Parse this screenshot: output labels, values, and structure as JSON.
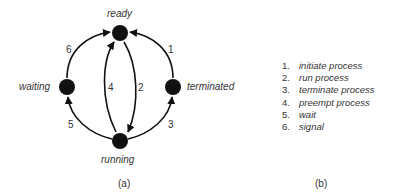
{
  "diagram": {
    "nodes": [
      {
        "id": "ready",
        "label": "ready"
      },
      {
        "id": "waiting",
        "label": "waiting"
      },
      {
        "id": "terminated",
        "label": "terminated"
      },
      {
        "id": "running",
        "label": "running"
      }
    ],
    "edges": [
      {
        "number": "1",
        "from": "terminated",
        "to": "ready"
      },
      {
        "number": "2",
        "from": "ready",
        "to": "running"
      },
      {
        "number": "3",
        "from": "running",
        "to": "terminated"
      },
      {
        "number": "4",
        "from": "running",
        "to": "ready"
      },
      {
        "number": "5",
        "from": "running",
        "to": "waiting"
      },
      {
        "number": "6",
        "from": "waiting",
        "to": "ready"
      }
    ],
    "caption": "(a)"
  },
  "legend": {
    "items": [
      {
        "n": "1.",
        "text": "initiate process"
      },
      {
        "n": "2.",
        "text": "run process"
      },
      {
        "n": "3.",
        "text": "terminate process"
      },
      {
        "n": "4.",
        "text": "preempt process"
      },
      {
        "n": "5.",
        "text": "wait"
      },
      {
        "n": "6.",
        "text": "signal"
      }
    ],
    "caption": "(b)"
  }
}
